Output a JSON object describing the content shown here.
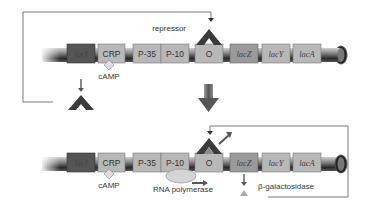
{
  "diagram": {
    "top_state": {
      "label_repressor": "repressor",
      "boxes": [
        {
          "id": "lacI",
          "label": "lacI",
          "italic": true,
          "color": "#555555"
        },
        {
          "id": "CRP",
          "label": "CRP",
          "italic": false,
          "color": "#b8b8b8"
        },
        {
          "id": "P35",
          "label": "P-35",
          "italic": false,
          "color": "#b8b8b8"
        },
        {
          "id": "P10",
          "label": "P-10",
          "italic": false,
          "color": "#b8b8b8"
        },
        {
          "id": "O",
          "label": "O",
          "italic": false,
          "color": "#b8b8b8"
        },
        {
          "id": "lacZ",
          "label": "lacZ",
          "italic": true,
          "color": "#999999"
        },
        {
          "id": "lacY",
          "label": "lacY",
          "italic": true,
          "color": "#b8b8b8"
        },
        {
          "id": "lacA",
          "label": "lacA",
          "italic": true,
          "color": "#b8b8b8"
        }
      ],
      "label_cAMP": "cAMP"
    },
    "bottom_state": {
      "boxes": [
        {
          "id": "lacI",
          "label": "lacI"
        },
        {
          "id": "CRP",
          "label": "CRP"
        },
        {
          "id": "P35",
          "label": "P-35"
        },
        {
          "id": "P10",
          "label": "P-10"
        },
        {
          "id": "O",
          "label": "O"
        },
        {
          "id": "lacZ",
          "label": "lacZ"
        },
        {
          "id": "lacY",
          "label": "lacY"
        },
        {
          "id": "lacA",
          "label": "lacA"
        }
      ],
      "label_cAMP": "cAMP",
      "label_rna_polymerase": "RNA polymerase",
      "label_beta_gal": "β-galactosidase"
    },
    "colors": {
      "dark_box": "#555555",
      "light_box": "#b8b8b8",
      "mid_box": "#9a9a9a",
      "repressor": "#3a3a3a",
      "inducer_fill": "#8a8a8a",
      "line": "#444444"
    }
  }
}
